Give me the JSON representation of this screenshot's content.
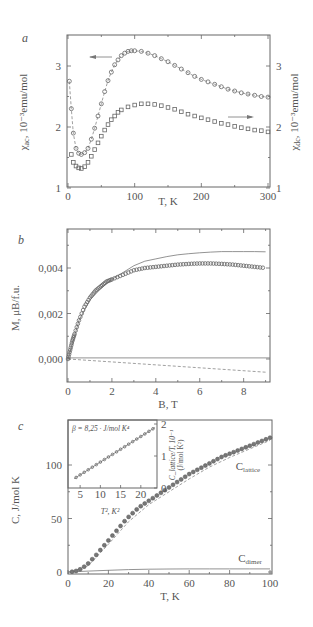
{
  "figure": {
    "panels": [
      "a",
      "b",
      "c"
    ]
  },
  "chart_data": [
    {
      "panel": "a",
      "type": "scatter",
      "xlabel": "T, K",
      "ylabel_left": "χac, 10⁻³ emu/mol",
      "ylabel_right": "χdc, 10⁻³ emu/mol",
      "xlim": [
        0,
        300
      ],
      "ylim": [
        1,
        3.5
      ],
      "xticks": [
        0,
        100,
        200,
        300
      ],
      "yticks_left": [
        1,
        2,
        3
      ],
      "yticks_right": [
        1,
        2,
        3
      ],
      "annotations": [
        "left arrow → χac (left axis)",
        "right arrow → χdc (right axis)"
      ],
      "series": [
        {
          "name": "χac",
          "axis": "left",
          "marker": "open-circle",
          "x": [
            2,
            5,
            8,
            12,
            16,
            20,
            25,
            30,
            35,
            40,
            45,
            50,
            55,
            60,
            65,
            70,
            75,
            80,
            85,
            90,
            95,
            100,
            110,
            120,
            130,
            140,
            150,
            160,
            170,
            180,
            190,
            200,
            210,
            220,
            230,
            240,
            250,
            260,
            270,
            280,
            290,
            300
          ],
          "y": [
            2.75,
            2.3,
            1.9,
            1.65,
            1.57,
            1.55,
            1.58,
            1.65,
            1.8,
            1.98,
            2.18,
            2.38,
            2.58,
            2.76,
            2.9,
            3.02,
            3.1,
            3.17,
            3.21,
            3.24,
            3.25,
            3.25,
            3.24,
            3.21,
            3.17,
            3.12,
            3.07,
            3.01,
            2.95,
            2.89,
            2.83,
            2.78,
            2.74,
            2.7,
            2.66,
            2.62,
            2.59,
            2.56,
            2.54,
            2.52,
            2.5,
            2.49
          ]
        },
        {
          "name": "χdc",
          "axis": "right",
          "marker": "open-square",
          "x": [
            5,
            8,
            12,
            16,
            20,
            25,
            30,
            35,
            40,
            45,
            50,
            55,
            60,
            65,
            70,
            75,
            80,
            90,
            100,
            110,
            120,
            130,
            140,
            150,
            160,
            170,
            180,
            190,
            200,
            210,
            220,
            230,
            240,
            250,
            260,
            270,
            280,
            290,
            300
          ],
          "y": [
            1.55,
            1.42,
            1.36,
            1.33,
            1.32,
            1.35,
            1.42,
            1.52,
            1.63,
            1.74,
            1.85,
            1.95,
            2.04,
            2.12,
            2.18,
            2.24,
            2.28,
            2.33,
            2.36,
            2.38,
            2.38,
            2.37,
            2.35,
            2.32,
            2.29,
            2.25,
            2.21,
            2.18,
            2.15,
            2.12,
            2.09,
            2.06,
            2.04,
            2.01,
            1.99,
            1.97,
            1.95,
            1.94,
            1.92
          ]
        }
      ]
    },
    {
      "panel": "b",
      "type": "line",
      "xlabel": "B, T",
      "ylabel": "M, μB/f.u.",
      "xlim": [
        0,
        9.2
      ],
      "ylim": [
        -0.001,
        0.0057
      ],
      "xticks": [
        0,
        2,
        4,
        6,
        8
      ],
      "yticks": [
        "0,000",
        "0,002",
        "0,004"
      ],
      "ytick_values": [
        0,
        0.002,
        0.004
      ],
      "series": [
        {
          "name": "measured M",
          "marker": "open-circle",
          "x": [
            0,
            0.1,
            0.2,
            0.3,
            0.5,
            0.75,
            1,
            1.25,
            1.5,
            1.75,
            2,
            2.5,
            3,
            3.5,
            4,
            4.5,
            5,
            5.5,
            6,
            6.5,
            7,
            7.5,
            8,
            8.5,
            9
          ],
          "y": [
            0.0,
            0.0004,
            0.0008,
            0.0011,
            0.0017,
            0.0023,
            0.0027,
            0.003,
            0.0032,
            0.0034,
            0.0035,
            0.0037,
            0.0039,
            0.004,
            0.00405,
            0.0041,
            0.00415,
            0.00418,
            0.0042,
            0.0042,
            0.00418,
            0.00415,
            0.0041,
            0.00405,
            0.004
          ]
        },
        {
          "name": "model (solid)",
          "marker": "none",
          "x": [
            0,
            0.5,
            1,
            1.5,
            2,
            2.5,
            3,
            3.5,
            4,
            4.5,
            5,
            5.5,
            6,
            6.5,
            7,
            7.5,
            8,
            8.5,
            9
          ],
          "y": [
            0.0,
            0.0017,
            0.0026,
            0.0031,
            0.0035,
            0.0038,
            0.0041,
            0.0043,
            0.0044,
            0.0045,
            0.00458,
            0.00463,
            0.00467,
            0.0047,
            0.00472,
            0.00472,
            0.00472,
            0.00472,
            0.00471
          ]
        },
        {
          "name": "zero line",
          "marker": "none",
          "x": [
            0,
            9.2
          ],
          "y": [
            5e-05,
            5e-05
          ]
        },
        {
          "name": "diamagnetic (dashed)",
          "marker": "none",
          "dashed": true,
          "x": [
            0,
            9
          ],
          "y": [
            0.0,
            -0.00058
          ]
        }
      ]
    },
    {
      "panel": "c",
      "type": "scatter",
      "xlabel": "T, K",
      "ylabel": "C, J/mol K",
      "xlim": [
        0,
        100
      ],
      "ylim": [
        -2,
        140
      ],
      "xticks": [
        0,
        20,
        40,
        60,
        80,
        100
      ],
      "yticks": [
        0,
        50,
        100
      ],
      "labels": [
        "C_lattice",
        "C_dimer"
      ],
      "series": [
        {
          "name": "C measured",
          "marker": "filled-circle",
          "x": [
            2,
            4,
            6,
            8,
            10,
            12,
            14,
            16,
            18,
            20,
            22,
            24,
            26,
            28,
            30,
            32,
            34,
            36,
            38,
            40,
            42,
            44,
            46,
            48,
            50,
            52,
            54,
            56,
            58,
            60,
            62,
            64,
            66,
            68,
            70,
            72,
            74,
            76,
            78,
            80,
            82,
            84,
            86,
            88,
            90,
            92,
            94,
            96,
            98,
            100
          ],
          "y": [
            0.3,
            1,
            2.5,
            5,
            8,
            12,
            16,
            20.5,
            25,
            29.5,
            34,
            38.5,
            43,
            47.5,
            51.5,
            55,
            58.5,
            61.5,
            64,
            66.5,
            69,
            71.5,
            74,
            76.5,
            79,
            81.5,
            84,
            86.5,
            89,
            91.5,
            93.5,
            95.5,
            97.5,
            99.5,
            101.5,
            103.5,
            105.5,
            107.5,
            109,
            110.5,
            112,
            113.5,
            115,
            116.5,
            118,
            119.5,
            121,
            122.5,
            124,
            125.5
          ]
        },
        {
          "name": "C_lattice (dashed)",
          "marker": "none",
          "dashed": true,
          "x": [
            2,
            10,
            20,
            30,
            40,
            50,
            60,
            70,
            80,
            90,
            100
          ],
          "y": [
            0.2,
            6,
            26,
            47,
            63,
            75,
            87,
            98,
            107,
            115,
            123
          ]
        },
        {
          "name": "C_dimer",
          "marker": "none",
          "x": [
            0,
            10,
            20,
            30,
            40,
            50,
            60,
            70,
            80,
            90,
            100
          ],
          "y": [
            0,
            0.8,
            1.6,
            2.2,
            2.6,
            2.8,
            2.9,
            2.9,
            2.9,
            2.9,
            2.9
          ]
        }
      ],
      "inset": {
        "type": "scatter",
        "title": "β = 8,25 · J/mol K⁴",
        "xlabel": "T², K²",
        "ylabel": "C_lattice/T, 10⁻¹ (J/mol K²)",
        "xlim": [
          2,
          24
        ],
        "ylim": [
          0,
          2.1
        ],
        "xticks": [
          5,
          10,
          15,
          20
        ],
        "yticks": [
          0,
          1,
          2
        ],
        "series": [
          {
            "name": "C_lattice/T vs T²",
            "marker": "open-circle",
            "x": [
              4,
              5,
              6,
              7,
              8,
              9,
              10,
              11,
              12,
              13,
              14,
              15,
              16,
              17,
              18,
              19,
              20,
              21,
              22,
              23
            ],
            "y": [
              0.33,
              0.41,
              0.49,
              0.57,
              0.65,
              0.73,
              0.81,
              0.89,
              0.97,
              1.05,
              1.13,
              1.21,
              1.29,
              1.37,
              1.45,
              1.53,
              1.61,
              1.69,
              1.77,
              1.85
            ]
          }
        ]
      }
    }
  ],
  "text": {
    "a_label": "a",
    "b_label": "b",
    "c_label": "c",
    "a_xlabel": "T, K",
    "a_ylabel_left_sym": "χ",
    "a_ylabel_left_sub": "ac",
    "a_ylabel_left_rest": ", 10⁻³emu/mol",
    "a_ylabel_right_sym": "χ",
    "a_ylabel_right_sub": "dc",
    "a_ylabel_right_rest": ", 10⁻³emu/mol",
    "b_xlabel": "B, T",
    "b_ylabel": "M, μB/f.u.",
    "c_xlabel": "T, K",
    "c_ylabel": "C, J/mol K",
    "c_lattice_label": "C",
    "c_lattice_sub": "lattice",
    "c_dimer_label": "C",
    "c_dimer_sub": "dimer",
    "inset_title": "β = 8,25 · J/mol K⁴",
    "inset_xlabel": "T², K²",
    "inset_ylabel_1": "C_lattice/T, 10⁻¹",
    "inset_ylabel_2": "(J/mol K²)"
  }
}
